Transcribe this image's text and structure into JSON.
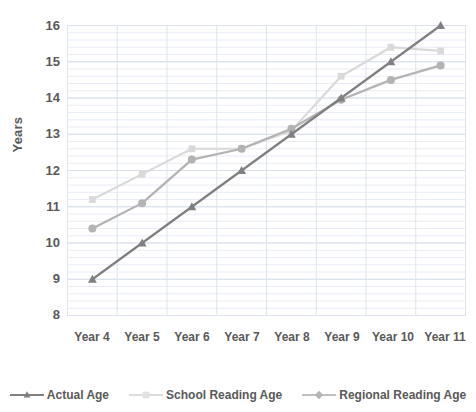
{
  "chart_data": {
    "type": "line",
    "title": "",
    "xlabel": "School Year",
    "ylabel": "Years",
    "categories": [
      "Year 4",
      "Year 5",
      "Year 6",
      "Year 7",
      "Year 8",
      "Year 9",
      "Year 10",
      "Year 11"
    ],
    "ylim": [
      8,
      16
    ],
    "yticks": [
      8,
      9,
      10,
      11,
      12,
      13,
      14,
      15,
      16
    ],
    "grid": "horizontal-minor-and-major, vertical-major",
    "legend_position": "bottom",
    "series": [
      {
        "name": "Actual Age",
        "color": "#808080",
        "marker": "triangle",
        "values": [
          9.0,
          10.0,
          11.0,
          12.0,
          13.0,
          14.0,
          15.0,
          16.0
        ]
      },
      {
        "name": "School Reading Age",
        "color": "#d9d9d9",
        "marker": "square",
        "values": [
          11.2,
          11.9,
          12.6,
          12.6,
          13.1,
          14.6,
          15.4,
          15.3
        ]
      },
      {
        "name": "Regional Reading Age",
        "color": "#b3b3b3",
        "marker": "circle",
        "values": [
          10.4,
          11.1,
          12.3,
          12.6,
          13.15,
          13.95,
          14.5,
          14.9
        ]
      }
    ]
  },
  "axis": {
    "y_tick_labels": [
      "16",
      "15",
      "14",
      "13",
      "12",
      "11",
      "10",
      "9",
      "8"
    ],
    "y_title": "Years",
    "x_title": "School Year",
    "x_tick_labels": [
      "Year 4",
      "Year 5",
      "Year 6",
      "Year 7",
      "Year 8",
      "Year 9",
      "Year 10",
      "Year 11"
    ]
  },
  "legend": {
    "items": [
      {
        "label": "Actual Age",
        "color": "#808080",
        "marker": "triangle"
      },
      {
        "label": "School Reading Age",
        "color": "#d9d9d9",
        "marker": "square"
      },
      {
        "label": "Regional Reading Age",
        "color": "#bfbfbf",
        "marker": "diamond"
      }
    ]
  },
  "style": {
    "gridline_color": "#dde3ef",
    "axis_color": "#d0d7e5",
    "text_color": "#595959",
    "background": "#ffffff"
  }
}
